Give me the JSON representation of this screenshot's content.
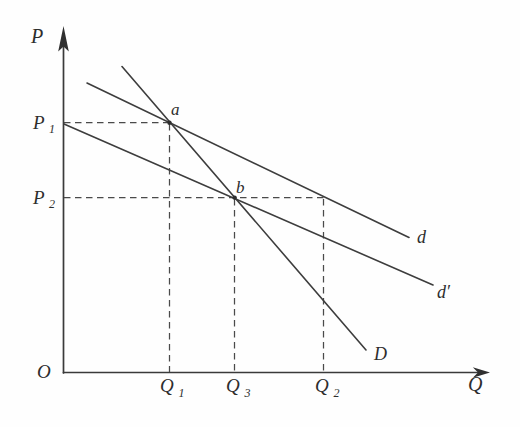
{
  "diagram": {
    "colors": {
      "background": "#fefefe",
      "line": "#3a3a3a",
      "text": "#2d2d2d"
    },
    "axes": {
      "vertical_label": "P",
      "horizontal_label": "Q",
      "origin_label": "O"
    },
    "price_ticks": [
      {
        "base": "P",
        "sub": "1"
      },
      {
        "base": "P",
        "sub": "2"
      }
    ],
    "quantity_ticks": [
      {
        "base": "Q",
        "sub": "1"
      },
      {
        "base": "Q",
        "sub": "3"
      },
      {
        "base": "Q",
        "sub": "2"
      }
    ],
    "points": [
      {
        "label": "a"
      },
      {
        "label": "b"
      }
    ],
    "curves": [
      {
        "label": "d"
      },
      {
        "label": "d′"
      },
      {
        "label": "D"
      }
    ]
  }
}
